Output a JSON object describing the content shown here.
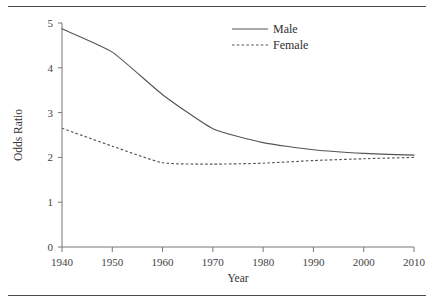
{
  "chart_data": {
    "type": "line",
    "title": "",
    "xlabel": "Year",
    "ylabel": "Odds Ratio",
    "x": [
      1940,
      1950,
      1960,
      1970,
      1980,
      1990,
      2000,
      2010
    ],
    "xlim": [
      1940,
      2010
    ],
    "ylim": [
      0,
      5
    ],
    "xticks": [
      "1940",
      "1950",
      "1960",
      "1970",
      "1980",
      "1990",
      "2000",
      "2010"
    ],
    "yticks": [
      "0",
      "1",
      "2",
      "3",
      "4",
      "5"
    ],
    "grid": false,
    "legend_position": "top-center",
    "series": [
      {
        "name": "Male",
        "style": "solid",
        "color": "#555555",
        "values": [
          4.87,
          4.35,
          3.4,
          2.64,
          2.33,
          2.17,
          2.09,
          2.05
        ]
      },
      {
        "name": "Female",
        "style": "dotted",
        "color": "#555555",
        "values": [
          2.65,
          2.25,
          1.88,
          1.85,
          1.87,
          1.93,
          1.97,
          2.0
        ]
      }
    ]
  },
  "legend": {
    "entries": [
      {
        "label": "Male"
      },
      {
        "label": "Female"
      }
    ]
  },
  "axes": {
    "y_title": "Odds Ratio",
    "x_title": "Year"
  }
}
